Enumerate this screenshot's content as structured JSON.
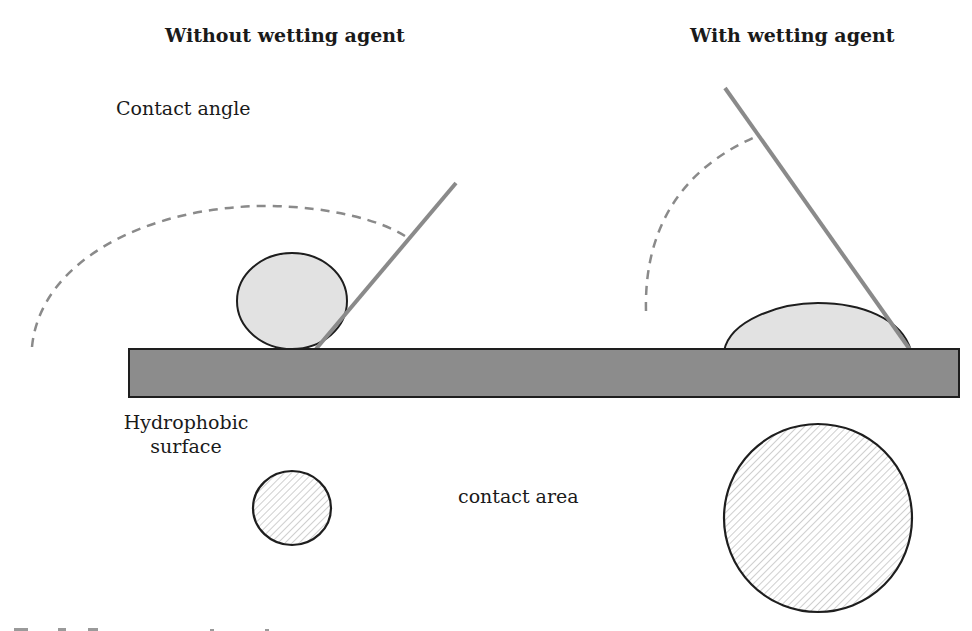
{
  "titles": {
    "left": "Without wetting agent",
    "right": "With wetting agent"
  },
  "labels": {
    "contact_angle": "Contact angle",
    "surface_line1": "Hydrophobic",
    "surface_line2": "surface",
    "contact_area": "contact area"
  },
  "colors": {
    "substrate_fill": "#8c8c8c",
    "droplet_fill": "#e2e2e2",
    "outline": "#1e1e1e",
    "tangent_line": "#8a8a8a",
    "arc_dash": "#8a8a8a",
    "hatch": "#b5b5b5"
  },
  "scenes": [
    {
      "name": "without-wetting-agent",
      "droplet_shape": "near-spherical",
      "contact_angle": "obtuse",
      "contact_area_size": "small"
    },
    {
      "name": "with-wetting-agent",
      "droplet_shape": "flattened-cap",
      "contact_angle": "acute",
      "contact_area_size": "large"
    }
  ]
}
